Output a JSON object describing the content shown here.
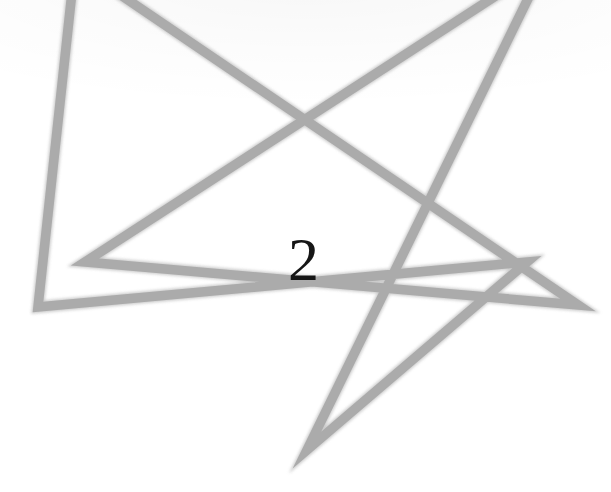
{
  "page": {
    "background_color": "#ffffff",
    "width": 611,
    "height": 492,
    "caption_label": "2"
  },
  "figure": {
    "name": "unicursal-hexagram",
    "stroke_color": "#ababab",
    "stroke_color_soft": "#c2c2c2",
    "stroke_width": 9.5,
    "cropped_at_top": true,
    "points_count": 6,
    "vertices": [
      {
        "name": "top-left-apex",
        "x": 75,
        "y": -36
      },
      {
        "name": "right-tip",
        "x": 578,
        "y": 305
      },
      {
        "name": "inner-left-v",
        "x": 85,
        "y": 262
      },
      {
        "name": "top-right-apex",
        "x": 545,
        "y": -36
      },
      {
        "name": "bottom-apex",
        "x": 307,
        "y": 450
      },
      {
        "name": "inner-right-v",
        "x": 527,
        "y": 262
      },
      {
        "name": "left-tip",
        "x": 38,
        "y": 307
      }
    ],
    "path": "M 75 -36 L 578 305 L 85 262 L 545 -36 L 307 450 L 527 262 L 38 307 Z"
  },
  "number": {
    "value": "2",
    "color": "#161616",
    "font_size_px": 62,
    "left_px": 288,
    "top_px": 228
  }
}
